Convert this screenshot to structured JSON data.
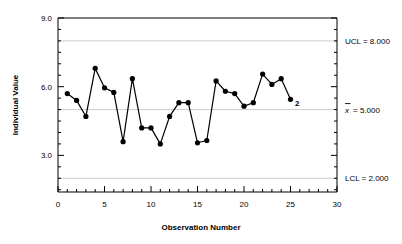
{
  "chart_data": {
    "type": "line",
    "title": "",
    "xlabel": "Observation Number",
    "ylabel": "Individual Value",
    "xlim": [
      0,
      30
    ],
    "ylim": [
      1.4,
      9.0
    ],
    "xticks": [
      0,
      5,
      10,
      15,
      20,
      25,
      30
    ],
    "xtick_labels": [
      "0",
      "5",
      "10",
      "15",
      "20",
      "25",
      "30"
    ],
    "yticks": [
      3.0,
      6.0,
      9.0
    ],
    "ytick_labels": [
      "3.0",
      "6.0",
      "9.0"
    ],
    "x_minor_tick_step": 1,
    "y_minor_tick_step": 0.5,
    "grid": false,
    "legend": "none",
    "x": [
      1,
      2,
      3,
      4,
      5,
      6,
      7,
      8,
      9,
      10,
      11,
      12,
      13,
      14,
      15,
      16,
      17,
      18,
      19,
      20,
      21,
      22,
      23,
      24,
      25
    ],
    "values": [
      5.7,
      5.4,
      4.7,
      6.8,
      5.95,
      5.75,
      3.6,
      6.35,
      4.2,
      4.2,
      3.5,
      4.7,
      5.3,
      5.3,
      3.55,
      3.65,
      6.25,
      5.8,
      5.7,
      5.15,
      5.3,
      6.55,
      6.1,
      6.35,
      5.45
    ],
    "series": [
      {
        "name": "Individual Value",
        "values": [
          5.7,
          5.4,
          4.7,
          6.8,
          5.95,
          5.75,
          3.6,
          6.35,
          4.2,
          4.2,
          3.5,
          4.7,
          5.3,
          5.3,
          3.55,
          3.65,
          6.25,
          5.8,
          5.7,
          5.15,
          5.3,
          6.55,
          6.1,
          6.35,
          5.45
        ]
      }
    ],
    "reference_lines": [
      {
        "name": "UCL",
        "value": 8.0,
        "label": "UCL = 8.000"
      },
      {
        "name": "CL",
        "value": 5.0,
        "label": "= 5.000",
        "symbol": "x",
        "overbar": true
      },
      {
        "name": "LCL",
        "value": 2.0,
        "label": "LCL = 2.000"
      }
    ],
    "annotations": [
      {
        "text": "2",
        "x": 25,
        "y": 5.45
      }
    ],
    "marker": "filled-circle",
    "line_color": "#000000",
    "marker_color": "#000000",
    "reference_line_color": "#cccccc",
    "axis_color": "#000000"
  },
  "labels": {
    "y_axis_title": "Individual Value",
    "x_axis_title": "Observation Number",
    "ucl_label": "UCL = 8.000",
    "cl_symbol": "x",
    "cl_label": "= 5.000",
    "lcl_label": "LCL = 2.000",
    "violation_label": "2"
  }
}
